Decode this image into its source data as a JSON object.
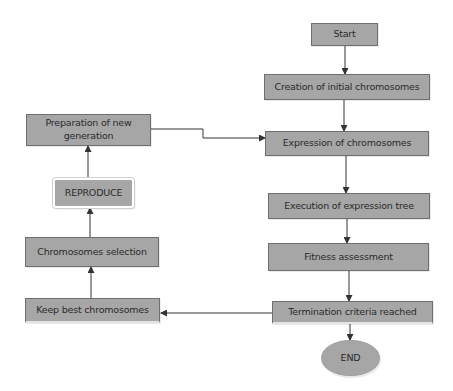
{
  "diagram": {
    "type": "flowchart",
    "colors": {
      "node_fill": "#a6a6a6",
      "node_border": "#6e6e6e",
      "text": "#2b2b2b",
      "edge": "#333333"
    },
    "nodes": [
      {
        "id": "start",
        "label": "Start"
      },
      {
        "id": "creation",
        "label": "Creation of initial chromosomes"
      },
      {
        "id": "expression",
        "label": "Expression of chromosomes"
      },
      {
        "id": "execution",
        "label": "Execution of expression tree"
      },
      {
        "id": "fitness",
        "label": "Fitness assessment"
      },
      {
        "id": "termination",
        "label": "Termination criteria reached"
      },
      {
        "id": "end",
        "label": "END"
      },
      {
        "id": "keep_best",
        "label": "Keep best chromosomes"
      },
      {
        "id": "selection",
        "label": "Chromosomes selection"
      },
      {
        "id": "reproduce",
        "label": "REPRODUCE"
      },
      {
        "id": "preparation",
        "label": "Preparation of new generation"
      }
    ],
    "edges": [
      {
        "from": "start",
        "to": "creation"
      },
      {
        "from": "creation",
        "to": "expression"
      },
      {
        "from": "expression",
        "to": "execution"
      },
      {
        "from": "execution",
        "to": "fitness"
      },
      {
        "from": "fitness",
        "to": "termination"
      },
      {
        "from": "termination",
        "to": "end"
      },
      {
        "from": "termination",
        "to": "keep_best"
      },
      {
        "from": "keep_best",
        "to": "selection"
      },
      {
        "from": "selection",
        "to": "reproduce"
      },
      {
        "from": "reproduce",
        "to": "preparation"
      },
      {
        "from": "preparation",
        "to": "expression"
      }
    ]
  }
}
